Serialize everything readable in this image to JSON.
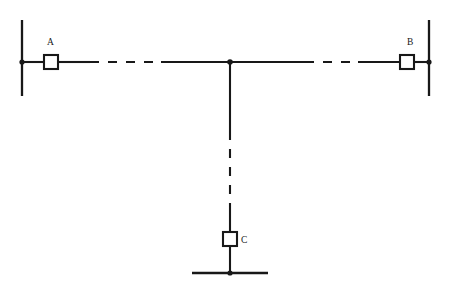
{
  "diagram": {
    "type": "single-line-electrical-schematic",
    "background_color": "#ffffff",
    "line_color": "#181818",
    "fill_color": "#ffffff",
    "canvas": {
      "width": 455,
      "height": 289
    }
  },
  "terminals": [
    {
      "id": "A",
      "label": "A",
      "label_position": "above-left",
      "label_x": 47,
      "label_y": 45,
      "breaker": {
        "x": 44,
        "y": 55,
        "size": 14
      },
      "busbar": {
        "x": 22,
        "y1": 20,
        "y2": 96,
        "orientation": "vertical"
      },
      "node": {
        "x": 22,
        "y": 62,
        "radius": 2.6
      }
    },
    {
      "id": "B",
      "label": "B",
      "label_position": "above-left",
      "label_x": 407,
      "label_y": 45,
      "breaker": {
        "x": 400,
        "y": 55,
        "size": 14
      },
      "busbar": {
        "x": 429,
        "y1": 20,
        "y2": 96,
        "orientation": "vertical"
      },
      "node": {
        "x": 429,
        "y": 62,
        "radius": 2.6
      }
    },
    {
      "id": "C",
      "label": "C",
      "label_position": "right",
      "label_x": 241,
      "label_y": 243,
      "breaker": {
        "x": 223,
        "y": 232,
        "size": 14
      },
      "busbar": {
        "x1": 192,
        "x2": 268,
        "y": 273,
        "orientation": "horizontal"
      },
      "node": {
        "x": 230,
        "y": 273,
        "radius": 2.6
      }
    }
  ],
  "tap_junction": {
    "name": "tap-point",
    "x": 230,
    "y": 62,
    "radius": 2.8
  },
  "branches": [
    {
      "name": "branch-a-to-tap",
      "from": "A",
      "to": "tap-point",
      "orientation": "horizontal",
      "y": 62,
      "segments": [
        {
          "style": "solid",
          "x1": 22,
          "x2": 44
        },
        {
          "style": "solid",
          "x1": 58,
          "x2": 90
        },
        {
          "style": "dashed",
          "x1": 90,
          "x2": 161,
          "dash": "9 9"
        },
        {
          "style": "solid",
          "x1": 161,
          "x2": 230
        }
      ]
    },
    {
      "name": "branch-tap-to-b",
      "from": "tap-point",
      "to": "B",
      "orientation": "horizontal",
      "y": 62,
      "segments": [
        {
          "style": "solid",
          "x1": 230,
          "x2": 305
        },
        {
          "style": "dashed",
          "x1": 305,
          "x2": 358,
          "dash": "9 9"
        },
        {
          "style": "solid",
          "x1": 358,
          "x2": 400
        },
        {
          "style": "solid",
          "x1": 414,
          "x2": 429
        }
      ]
    },
    {
      "name": "branch-tap-to-c",
      "from": "tap-point",
      "to": "C",
      "orientation": "vertical",
      "x": 230,
      "segments": [
        {
          "style": "solid",
          "y1": 62,
          "y2": 131
        },
        {
          "style": "dashed",
          "y1": 131,
          "y2": 204,
          "dash": "9 9"
        },
        {
          "style": "solid",
          "y1": 204,
          "y2": 232
        },
        {
          "style": "solid",
          "y1": 246,
          "y2": 273
        }
      ]
    }
  ],
  "legend_semantics": {
    "square_symbol": "circuit-breaker",
    "heavy_bar_symbol": "busbar",
    "filled_dot_symbol": "connection-node",
    "dashed_segment_meaning": "line-section-continuation"
  }
}
